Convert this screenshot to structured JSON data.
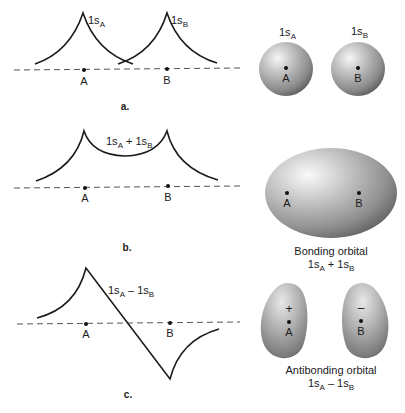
{
  "panels": {
    "a": {
      "tag": "a.",
      "wave_label_A": "1s",
      "wave_label_A_sub": "A",
      "wave_label_B": "1s",
      "wave_label_B_sub": "B",
      "nucleus_A": "A",
      "nucleus_B": "B",
      "sphere_A_title": "1s",
      "sphere_A_sub": "A",
      "sphere_B_title": "1s",
      "sphere_B_sub": "B"
    },
    "b": {
      "tag": "b.",
      "wave_label_1": "1s",
      "wave_label_1_sub": "A",
      "wave_label_op": " + 1s",
      "wave_label_2_sub": "B",
      "nucleus_A": "A",
      "nucleus_B": "B",
      "caption": "Bonding orbital",
      "formula_1": "1s",
      "formula_1_sub": "A",
      "formula_op": " + 1s",
      "formula_2_sub": "B"
    },
    "c": {
      "tag": "c.",
      "wave_label_1": "1s",
      "wave_label_1_sub": "A",
      "wave_label_op": " – 1s",
      "wave_label_2_sub": "B",
      "nucleus_A": "A",
      "nucleus_B": "B",
      "sign_A": "+",
      "sign_B": "–",
      "caption": "Antibonding orbital",
      "formula_1": "1s",
      "formula_1_sub": "A",
      "formula_op": " – 1s",
      "formula_2_sub": "B"
    }
  },
  "colors": {
    "line": "#1a1a1a",
    "dash": "#555555",
    "orbital_light": "#f4f4f4",
    "orbital_mid": "#a8a8a8",
    "orbital_dark": "#5e5e5e"
  }
}
